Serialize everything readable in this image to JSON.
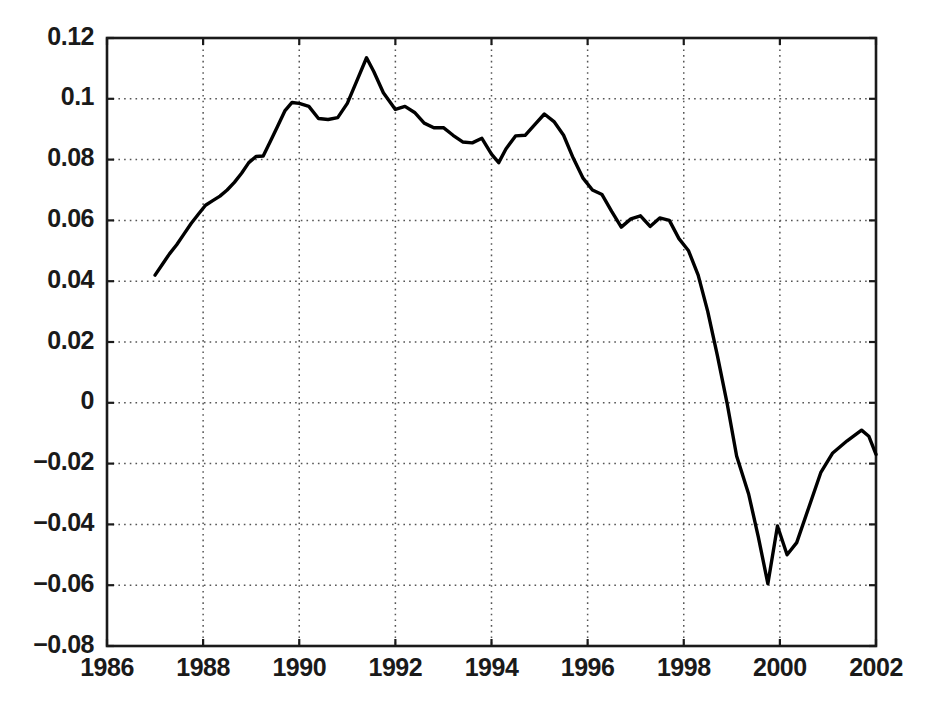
{
  "chart_data": {
    "type": "line",
    "title": "",
    "subtitle": "",
    "xlabel": "",
    "ylabel": "",
    "xlim": [
      1986,
      2002
    ],
    "ylim": [
      -0.08,
      0.12
    ],
    "xticks": [
      1986,
      1988,
      1990,
      1992,
      1994,
      1996,
      1998,
      2000,
      2002
    ],
    "xtick_labels": [
      "1986",
      "1988",
      "1990",
      "1992",
      "1994",
      "1996",
      "1998",
      "2000",
      "2002"
    ],
    "yticks": [
      -0.08,
      -0.06,
      -0.04,
      -0.02,
      0,
      0.02,
      0.04,
      0.06,
      0.08,
      0.1,
      0.12
    ],
    "ytick_labels": [
      "−0.08",
      "−0.06",
      "−0.04",
      "−0.02",
      "0",
      "0.02",
      "0.04",
      "0.06",
      "0.08",
      "0.1",
      "0.12"
    ],
    "grid": true,
    "grid_style": "dotted",
    "legend": null,
    "annotations": [],
    "line_color": "#000000",
    "line_width": 3.4,
    "series": [
      {
        "name": "series-1",
        "x": [
          1987.0,
          1987.15,
          1987.3,
          1987.45,
          1987.6,
          1987.75,
          1987.9,
          1988.05,
          1988.2,
          1988.35,
          1988.5,
          1988.65,
          1988.8,
          1988.95,
          1989.1,
          1989.25,
          1989.4,
          1989.55,
          1989.7,
          1989.85,
          1990.0,
          1990.2,
          1990.4,
          1990.6,
          1990.8,
          1991.0,
          1991.2,
          1991.4,
          1991.55,
          1991.75,
          1992.0,
          1992.2,
          1992.4,
          1992.6,
          1992.8,
          1993.0,
          1993.2,
          1993.4,
          1993.6,
          1993.8,
          1994.0,
          1994.15,
          1994.3,
          1994.5,
          1994.7,
          1994.9,
          1995.1,
          1995.3,
          1995.5,
          1995.7,
          1995.9,
          1996.1,
          1996.3,
          1996.5,
          1996.7,
          1996.9,
          1997.1,
          1997.3,
          1997.5,
          1997.7,
          1997.9,
          1998.1,
          1998.3,
          1998.5,
          1998.7,
          1998.9,
          1999.1,
          1999.35,
          1999.55,
          1999.75,
          1999.95,
          2000.15,
          2000.35,
          2000.6,
          2000.85,
          2001.1,
          2001.4,
          2001.7,
          2001.85,
          2002.0
        ],
        "y": [
          0.042,
          0.0455,
          0.049,
          0.052,
          0.0555,
          0.059,
          0.062,
          0.065,
          0.0665,
          0.068,
          0.07,
          0.0725,
          0.0755,
          0.079,
          0.081,
          0.0812,
          0.086,
          0.091,
          0.096,
          0.0988,
          0.0985,
          0.0975,
          0.0935,
          0.0932,
          0.0938,
          0.0985,
          0.106,
          0.1135,
          0.109,
          0.102,
          0.0965,
          0.0975,
          0.0955,
          0.092,
          0.0905,
          0.0905,
          0.088,
          0.0858,
          0.0855,
          0.087,
          0.0818,
          0.079,
          0.0835,
          0.0878,
          0.088,
          0.0915,
          0.095,
          0.0925,
          0.088,
          0.0805,
          0.074,
          0.07,
          0.0685,
          0.063,
          0.0578,
          0.0605,
          0.0615,
          0.058,
          0.0608,
          0.06,
          0.054,
          0.05,
          0.042,
          0.03,
          0.0155,
          0.0,
          -0.0175,
          -0.03,
          -0.044,
          -0.0595,
          -0.0405,
          -0.05,
          -0.046,
          -0.0345,
          -0.023,
          -0.0165,
          -0.0125,
          -0.009,
          -0.011,
          -0.017
        ]
      }
    ]
  },
  "axes": {
    "plot_left_px": 107,
    "plot_top_px": 38,
    "plot_right_px": 876,
    "plot_bottom_px": 646
  }
}
